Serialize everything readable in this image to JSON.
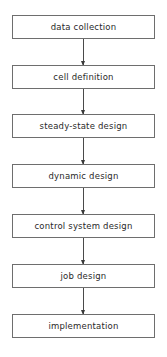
{
  "diagram": {
    "type": "flowchart",
    "direction": "top-to-bottom",
    "steps": [
      {
        "label": "data collection"
      },
      {
        "label": "cell definition"
      },
      {
        "label": "steady-state design"
      },
      {
        "label": "dynamic design"
      },
      {
        "label": "control system design"
      },
      {
        "label": "job design"
      },
      {
        "label": "implementation"
      }
    ],
    "edges": [
      {
        "from": "data collection",
        "to": "cell definition"
      },
      {
        "from": "cell definition",
        "to": "steady-state design"
      },
      {
        "from": "steady-state design",
        "to": "dynamic design"
      },
      {
        "from": "dynamic design",
        "to": "control system design"
      },
      {
        "from": "control system design",
        "to": "job design"
      },
      {
        "from": "job design",
        "to": "implementation"
      }
    ],
    "colors": {
      "box_border": "#6e6e6e",
      "text": "#2a2a2a",
      "arrow": "#3a3a3a",
      "background": "#ffffff"
    }
  }
}
